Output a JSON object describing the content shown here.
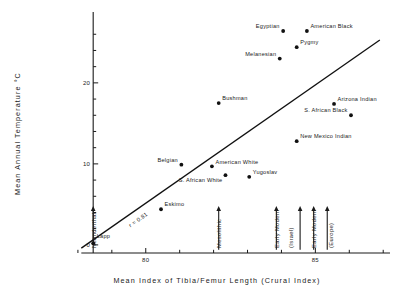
{
  "chart_data": {
    "type": "scatter",
    "title": "",
    "xlabel": "Mean Index of Tibia/Femur Length (Crural Index)",
    "ylabel": "Mean Annual Temperature °C",
    "xlim": [
      77.0,
      87.2
    ],
    "ylim": [
      -1.0,
      28.5
    ],
    "xticks": [
      78,
      79,
      80,
      81,
      82,
      83,
      84,
      85,
      86,
      87
    ],
    "xtick_labels": [
      "",
      "",
      "80",
      "",
      "",
      "",
      "",
      "85",
      "",
      ""
    ],
    "yticks": [
      0,
      2,
      4,
      6,
      8,
      10,
      12,
      14,
      16,
      18,
      20,
      22,
      24,
      26
    ],
    "ytick_labels": [
      "0",
      "",
      "",
      "",
      "",
      "10",
      "",
      "",
      "",
      "",
      "20",
      "",
      "",
      ""
    ],
    "grid": false,
    "legend": "none",
    "annotation": "r = 0.81",
    "correlation": 0.81,
    "trendline": {
      "x0": 78.1,
      "y0": -0.4,
      "x1": 86.9,
      "y1": 25.3
    },
    "points": [
      {
        "label": "Egyptian",
        "x": 84.05,
        "y": 26.4,
        "label_pos": "left"
      },
      {
        "label": "American Black",
        "x": 84.75,
        "y": 26.4,
        "label_pos": "right"
      },
      {
        "label": "Pygmy",
        "x": 84.45,
        "y": 24.4,
        "label_pos": "right"
      },
      {
        "label": "Melanesian",
        "x": 83.95,
        "y": 23.0,
        "label_pos": "left"
      },
      {
        "label": "Bushman",
        "x": 82.15,
        "y": 17.5,
        "label_pos": "right"
      },
      {
        "label": "Arizona Indian",
        "x": 85.55,
        "y": 17.4,
        "label_pos": "right"
      },
      {
        "label": "S. African Black",
        "x": 86.05,
        "y": 16.0,
        "label_pos": "left"
      },
      {
        "label": "New Mexico Indian",
        "x": 84.45,
        "y": 12.8,
        "label_pos": "right"
      },
      {
        "label": "Belgian",
        "x": 81.05,
        "y": 9.9,
        "label_pos": "left"
      },
      {
        "label": "American White",
        "x": 81.95,
        "y": 9.7,
        "label_pos": "right"
      },
      {
        "label": "S. African White",
        "x": 82.35,
        "y": 8.6,
        "label_pos": "below"
      },
      {
        "label": "Yugoslav",
        "x": 83.05,
        "y": 8.4,
        "label_pos": "right"
      },
      {
        "label": "Eskimo",
        "x": 80.45,
        "y": 4.4,
        "label_pos": "right"
      },
      {
        "label": "Lapp",
        "x": 78.45,
        "y": 0.2,
        "label_pos": "above"
      }
    ],
    "arrows": [
      {
        "label": "Neanderthal",
        "x": 78.45,
        "y_from": 0.0,
        "y_to": 4.6,
        "label_x_off": 3.0
      },
      {
        "label": "Mesolithic",
        "x": 82.15,
        "y_from": -0.6,
        "y_to": 4.6,
        "label_x_off": 3.0
      },
      {
        "label": "Early Modern (Israel)",
        "x": 83.85,
        "y_from": -0.6,
        "y_to": 4.6,
        "label_x_off": 3.0
      },
      {
        "label": "Early Modern (Israel) 2",
        "x": 84.55,
        "y_from": -0.6,
        "y_to": 4.6,
        "label_x_off": 0
      },
      {
        "label": "Early Modern (Europe)",
        "x": 84.95,
        "y_from": -0.6,
        "y_to": 4.6,
        "label_x_off": 3.0
      },
      {
        "label": "Early Modern (Europe) 2",
        "x": 85.35,
        "y_from": -0.6,
        "y_to": 4.6,
        "label_x_off": 0
      }
    ],
    "arrow_text_labels": [
      {
        "text": "Neanderthal",
        "x": 78.45
      },
      {
        "text": "Mesolithic",
        "x": 82.15
      },
      {
        "text": "Early Modern",
        "x": 83.85
      },
      {
        "text": "(Israel)",
        "x": 84.25
      },
      {
        "text": "Early Modern",
        "x": 84.95
      },
      {
        "text": "(Europe)",
        "x": 85.45
      }
    ]
  },
  "axes": {
    "y_title": "Mean  Annual  Temperature  °C",
    "x_title": "Mean  Index  of  Tibia/Femur  Length  (Crural Index)",
    "y_labels": [
      "0",
      "10",
      "20"
    ],
    "x_labels": [
      "80",
      "85"
    ]
  },
  "colors": {
    "ink": "#1a1a1a",
    "background": "#ffffff",
    "point": "#111111",
    "line": "#111111"
  }
}
